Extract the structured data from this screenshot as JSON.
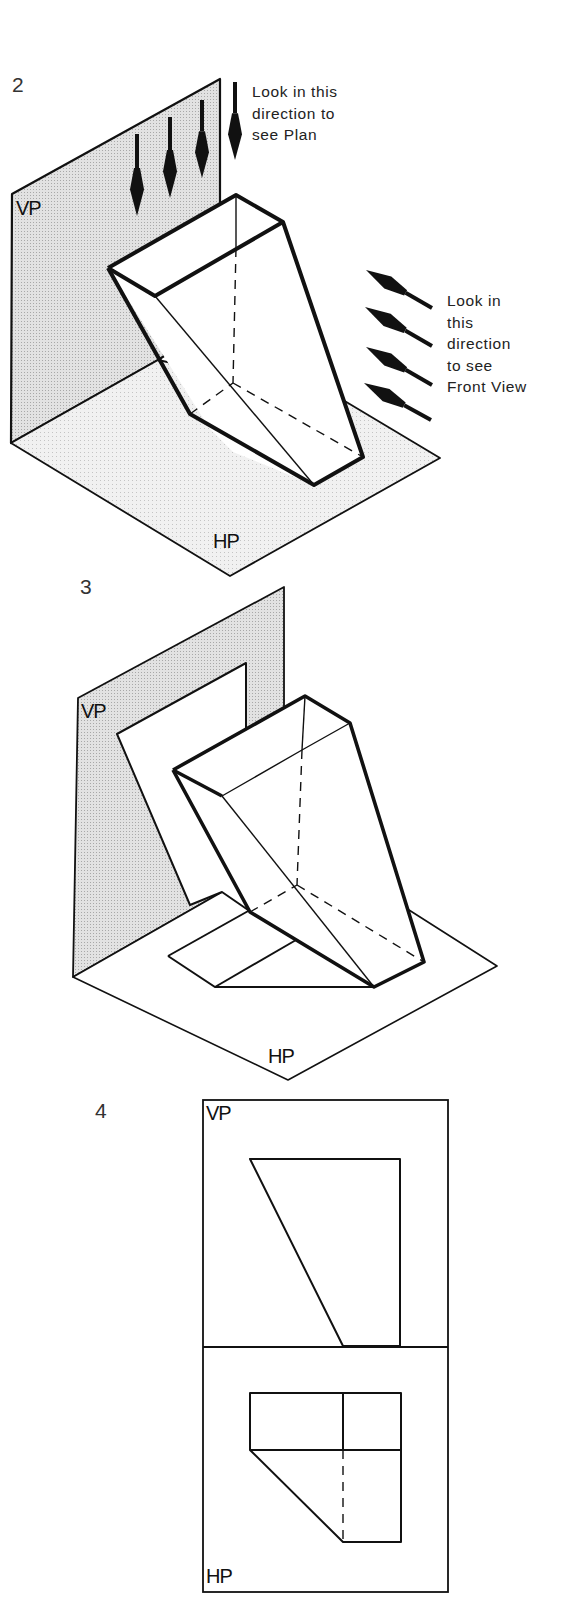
{
  "colors": {
    "ink": "#111111",
    "plane_fill": "#dcdcdc",
    "hp_fill": "#ececec",
    "paper": "#ffffff"
  },
  "figures": [
    {
      "number": "2",
      "vp_label": "VP",
      "hp_label": "HP",
      "plan_caption": [
        "Look in this",
        "direction to",
        "see Plan"
      ],
      "front_caption": [
        "Look in",
        "this",
        "direction",
        "to see",
        "Front View"
      ],
      "plan_arrows": [
        {
          "x": 137,
          "y1": 134,
          "y2": 216
        },
        {
          "x": 170,
          "y1": 117,
          "y2": 198
        },
        {
          "x": 202,
          "y1": 100,
          "y2": 178
        },
        {
          "x": 235,
          "y1": 82,
          "y2": 160
        }
      ],
      "front_arrows": [
        {
          "x1": 432,
          "y1": 308,
          "x2": 366,
          "y2": 270
        },
        {
          "x1": 432,
          "y1": 346,
          "x2": 365,
          "y2": 307
        },
        {
          "x1": 432,
          "y1": 385,
          "x2": 366,
          "y2": 347
        },
        {
          "x1": 431,
          "y1": 420,
          "x2": 364,
          "y2": 383
        }
      ],
      "vp_polygon": "12,194 220,79 220,320 158,360 11,443",
      "hp_polygon": "11,443 158,360 343,400 440,458 230,576",
      "prism": {
        "outline": "108,268 236,195 283,222 343,400 363,457 314,485 233,452 210,429",
        "edges_thick": [
          "108,268 236,195 283,222 363,457 314,485 190,414 108,268",
          "108,268 155,296 283,222"
        ],
        "edges_thin": [
          "236,195 236,248",
          "155,296 314,485"
        ],
        "edges_hidden": [
          "236,248 233,383",
          "190,414 233,383",
          "233,383 363,457"
        ]
      }
    },
    {
      "number": "3",
      "vp_label": "VP",
      "hp_label": "HP",
      "vp_polygon": "78,698 284,587 284,733 222,892 73,977",
      "hp_polygon": "73,977 222,892 409,910 497,966 288,1080",
      "elevation_projection": "117,734 246,663 246,745 229,770 251,912 222,892 190,905",
      "plan_projection": "168,956 250,910 296,932 215,987 372,987 254,984",
      "prism": {
        "outline": "173,770 305,696 350,723 424,962 374,987 250,912",
        "edges_thick": [
          "173,770 305,696 350,723 424,962 374,987 250,912 173,770",
          "173,770 222,796"
        ],
        "edges_thin": [
          "305,696 302,750",
          "222,796 302,750 350,723",
          "222,796 374,987"
        ],
        "edges_hidden": [
          "302,750 297,885",
          "250,912 297,885",
          "297,885 424,962"
        ],
        "plan_lines": [
          "168,956 250,910",
          "168,956 215,987 374,987",
          "215,987 296,940"
        ]
      }
    },
    {
      "number": "4",
      "vp_label": "VP",
      "hp_label": "HP",
      "frame": {
        "x": 203,
        "y": 1100,
        "w": 245,
        "h": 492,
        "divider_y": 1347
      },
      "elevation": "250,1159 400,1159 400,1346 343,1346",
      "plan": {
        "rect": "250,1393 401,1393 401,1542 343,1542 250,1450",
        "top_rect_lines": [
          "250,1393 250,1450",
          "250,1450 401,1450",
          "343,1393 343,1450"
        ],
        "hidden": "343,1450 343,1542"
      }
    }
  ]
}
